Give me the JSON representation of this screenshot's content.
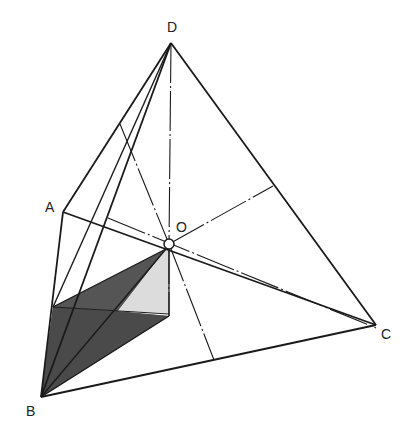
{
  "figure": {
    "type": "tetrahedron-with-center",
    "background": "#ffffff",
    "line_color": "#1a1a1a",
    "dark_shade": "#4a4a4a",
    "light_shade": "#d8d8d8"
  },
  "labels": {
    "D": "D",
    "A": "A",
    "O": "O",
    "B": "B",
    "C": "C"
  },
  "vertices": {
    "D": [
      171,
      43
    ],
    "A": [
      63,
      212
    ],
    "B": [
      41,
      397
    ],
    "C": [
      376,
      325
    ],
    "O": [
      169,
      244
    ]
  }
}
